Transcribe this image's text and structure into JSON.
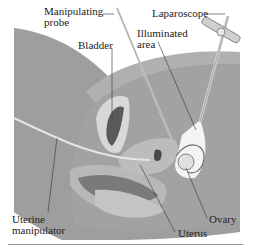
{
  "figure": {
    "labels": {
      "manipulating_probe_line1": "Manipulating",
      "manipulating_probe_line2": "probe",
      "laparoscope": "Laparoscope",
      "bladder": "Bladder",
      "illuminated_area_line1": "Illuminated",
      "illuminated_area_line2": "area",
      "uterine_manipulator_line1": "Uterine",
      "uterine_manipulator_line2": "manipulator",
      "ovary": "Ovary",
      "uterus": "Uterus"
    },
    "colors": {
      "background": "#ffffff",
      "body_outer": "#9e9e9e",
      "body_inner": "#b4b4b4",
      "abdominal_wall": "#a8a8a8",
      "organ_light": "#cfcfcf",
      "organ_mid": "#8c8c8c",
      "organ_dark": "#5a5a5a",
      "illuminated": "#f4f4f4",
      "leader_line": "#333333"
    }
  }
}
